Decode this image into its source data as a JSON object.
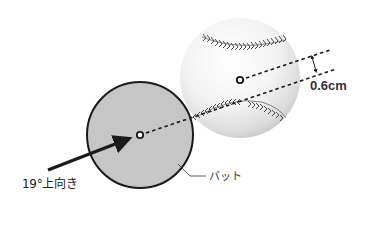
{
  "diagram": {
    "type": "physics-illustration",
    "labels": {
      "swing_angle": "19°上向き",
      "offset": "0.6cm",
      "bat": "バット"
    },
    "elements": {
      "bat": {
        "shape": "circle",
        "cx": 140,
        "cy": 135,
        "r": 53,
        "fill": "#c6c6c6",
        "stroke": "#1a1a1a"
      },
      "ball": {
        "shape": "circle",
        "cx": 240,
        "cy": 78,
        "r": 60,
        "fill": "#f2f2f2",
        "stroke": "none"
      },
      "bat_center": {
        "cx": 140,
        "cy": 135
      },
      "ball_center": {
        "cx": 240,
        "cy": 80
      },
      "swing_arrow": {
        "from": [
          48,
          170
        ],
        "to": [
          134,
          137
        ],
        "angle_deg": 19
      },
      "bat_axis_line": {
        "from": [
          146,
          133
        ],
        "to": [
          336,
          69
        ],
        "style": "dashed"
      },
      "ball_axis_line": {
        "from": [
          246,
          78
        ],
        "to": [
          330,
          50
        ],
        "style": "dashed"
      },
      "offset_marker": {
        "from": [
          312,
          56
        ],
        "to": [
          316,
          72
        ]
      }
    },
    "colors": {
      "line": "#1a1a1a",
      "bat_fill": "#c6c6c6",
      "ball_light": "#ffffff",
      "ball_shade": "#cfcfcf",
      "seam": "#555555"
    }
  }
}
